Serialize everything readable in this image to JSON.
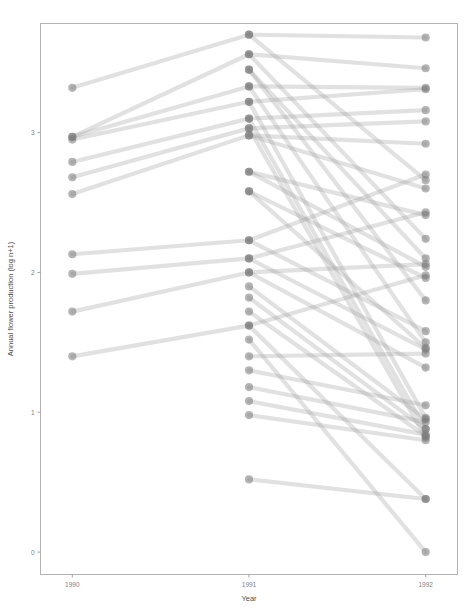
{
  "chart_data": {
    "type": "line",
    "title": "",
    "subtitle": "",
    "xlabel": "Year",
    "ylabel": "Annual flower production (log n+1)",
    "x": [
      1990,
      1991,
      1992
    ],
    "xtick_labels": [
      "1990",
      "1991",
      "1992"
    ],
    "ytick_labels": [
      "0",
      "1",
      "2",
      "3"
    ],
    "ytick_values": [
      0,
      1,
      2,
      3
    ],
    "ylim": [
      -0.16,
      3.78
    ],
    "xlim": [
      1989.82,
      1992.18
    ],
    "grid": false,
    "legend": null,
    "point_color": "#7a7a7a",
    "line_color": "#9a9a9a",
    "frame_color": "#b3b3b3",
    "series": [
      {
        "name": "plant-01",
        "values": [
          3.32,
          3.7,
          3.68
        ]
      },
      {
        "name": "plant-02",
        "values": [
          2.97,
          3.56,
          3.46
        ]
      },
      {
        "name": "plant-03",
        "values": [
          2.97,
          3.33,
          3.32
        ]
      },
      {
        "name": "plant-04",
        "values": [
          2.95,
          3.22,
          3.31
        ]
      },
      {
        "name": "plant-05",
        "values": [
          2.79,
          3.1,
          3.16
        ]
      },
      {
        "name": "plant-06",
        "values": [
          2.68,
          3.03,
          3.08
        ]
      },
      {
        "name": "plant-07",
        "values": [
          2.56,
          2.98,
          2.92
        ]
      },
      {
        "name": "plant-08",
        "values": [
          2.13,
          2.23,
          2.7
        ]
      },
      {
        "name": "plant-09",
        "values": [
          1.99,
          2.1,
          2.43
        ]
      },
      {
        "name": "plant-10",
        "values": [
          1.72,
          2.0,
          2.06
        ]
      },
      {
        "name": "plant-11",
        "values": [
          1.4,
          1.62,
          1.98
        ]
      },
      {
        "name": "plant-12",
        "values": [
          null,
          3.7,
          2.66
        ]
      },
      {
        "name": "plant-13",
        "values": [
          null,
          3.56,
          2.24
        ]
      },
      {
        "name": "plant-14",
        "values": [
          null,
          3.45,
          1.8
        ]
      },
      {
        "name": "plant-15",
        "values": [
          null,
          3.33,
          1.5
        ]
      },
      {
        "name": "plant-16",
        "values": [
          null,
          3.22,
          0.96
        ]
      },
      {
        "name": "plant-17",
        "values": [
          null,
          3.1,
          0.88
        ]
      },
      {
        "name": "plant-18",
        "values": [
          null,
          3.03,
          0.82
        ]
      },
      {
        "name": "plant-19",
        "values": [
          null,
          2.98,
          2.6
        ]
      },
      {
        "name": "plant-20",
        "values": [
          null,
          2.72,
          2.41
        ]
      },
      {
        "name": "plant-21",
        "values": [
          null,
          2.58,
          1.96
        ]
      },
      {
        "name": "plant-22",
        "values": [
          null,
          2.23,
          1.58
        ]
      },
      {
        "name": "plant-23",
        "values": [
          null,
          2.1,
          1.45
        ]
      },
      {
        "name": "plant-24",
        "values": [
          null,
          2.0,
          1.32
        ]
      },
      {
        "name": "plant-25",
        "values": [
          null,
          1.9,
          0.95
        ]
      },
      {
        "name": "plant-26",
        "values": [
          null,
          1.82,
          0.88
        ]
      },
      {
        "name": "plant-27",
        "values": [
          null,
          1.72,
          0.83
        ]
      },
      {
        "name": "plant-28",
        "values": [
          null,
          1.62,
          0.38
        ]
      },
      {
        "name": "plant-29",
        "values": [
          null,
          1.52,
          0.0
        ]
      },
      {
        "name": "plant-30",
        "values": [
          null,
          1.4,
          1.42
        ]
      },
      {
        "name": "plant-31",
        "values": [
          null,
          1.3,
          1.05
        ]
      },
      {
        "name": "plant-32",
        "values": [
          null,
          1.18,
          0.93
        ]
      },
      {
        "name": "plant-33",
        "values": [
          null,
          1.08,
          0.84
        ]
      },
      {
        "name": "plant-34",
        "values": [
          null,
          0.98,
          0.8
        ]
      },
      {
        "name": "plant-35",
        "values": [
          null,
          0.52,
          0.38
        ]
      },
      {
        "name": "plant-36",
        "values": [
          null,
          3.45,
          2.1
        ]
      },
      {
        "name": "plant-37",
        "values": [
          null,
          2.72,
          2.04
        ]
      },
      {
        "name": "plant-38",
        "values": [
          null,
          2.58,
          1.46
        ]
      }
    ]
  }
}
